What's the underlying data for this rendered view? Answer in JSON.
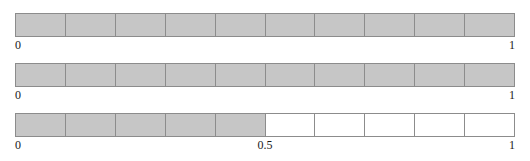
{
  "figure": {
    "title": "",
    "bar_count": 3,
    "cells_per_bar": 10,
    "colors": {
      "filled": "#c6c6c6",
      "empty": "#ffffff",
      "border": "#8c8c8c",
      "text": "#1a1a1a",
      "background": "#ffffff"
    }
  },
  "chart_data": {
    "type": "bar",
    "title": "",
    "subtitle": "",
    "xlabel": "",
    "ylabel": "",
    "xlim": [
      0,
      1
    ],
    "grid": false,
    "legend": null,
    "series": [
      {
        "name": "bar-1",
        "filled_cells": 10,
        "total_cells": 10,
        "value": 1,
        "cells": [
          1,
          1,
          1,
          1,
          1,
          1,
          1,
          1,
          1,
          1
        ],
        "tick_labels": [
          {
            "text": "0",
            "position": "start",
            "value": 0
          },
          {
            "text": "1",
            "position": "end",
            "value": 1
          }
        ]
      },
      {
        "name": "bar-2",
        "filled_cells": 10,
        "total_cells": 10,
        "value": 1,
        "cells": [
          1,
          1,
          1,
          1,
          1,
          1,
          1,
          1,
          1,
          1
        ],
        "tick_labels": [
          {
            "text": "0",
            "position": "start",
            "value": 0
          },
          {
            "text": "1",
            "position": "end",
            "value": 1
          }
        ]
      },
      {
        "name": "bar-3",
        "filled_cells": 5,
        "total_cells": 10,
        "value": 0.5,
        "cells": [
          1,
          1,
          1,
          1,
          1,
          0,
          0,
          0,
          0,
          0
        ],
        "tick_labels": [
          {
            "text": "0",
            "position": "start",
            "value": 0
          },
          {
            "text": "0.5",
            "position": "mid",
            "value": 0.5
          },
          {
            "text": "1",
            "position": "end",
            "value": 1
          }
        ]
      }
    ]
  }
}
